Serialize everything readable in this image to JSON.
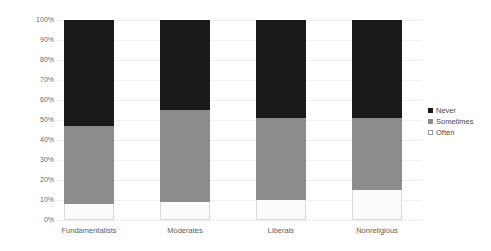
{
  "chart_data": {
    "type": "bar",
    "subtype": "stacked-100-percent",
    "title": "",
    "subtitle": "",
    "xlabel": "",
    "ylabel": "",
    "categories": [
      "Fundamentalists",
      "Moderates",
      "Liberals",
      "Nonreligious"
    ],
    "series": [
      {
        "name": "Never",
        "color": "#1a1a1a",
        "values": [
          53,
          45,
          49,
          49
        ]
      },
      {
        "name": "Sometimes",
        "color": "#8c8c8c",
        "values": [
          39,
          46,
          41,
          36
        ]
      },
      {
        "name": "Often",
        "color": "#ffffff",
        "values": [
          8,
          9,
          10,
          15
        ]
      }
    ],
    "stack_order_bottom_to_top": [
      "Often",
      "Sometimes",
      "Never"
    ],
    "cumulative_tops": {
      "Fundamentalists": {
        "Often": 8,
        "Sometimes": 47,
        "Never": 100
      },
      "Moderates": {
        "Often": 9,
        "Sometimes": 55,
        "Never": 100
      },
      "Liberals": {
        "Often": 10,
        "Sometimes": 51,
        "Never": 100
      },
      "Nonreligious": {
        "Often": 15,
        "Sometimes": 51,
        "Never": 100
      }
    },
    "ylim": [
      0,
      100
    ],
    "ytick_values": [
      0,
      10,
      20,
      30,
      40,
      50,
      60,
      70,
      80,
      90,
      100
    ],
    "ytick_labels": [
      "0%",
      "10%",
      "20%",
      "30%",
      "40%",
      "50%",
      "60%",
      "70%",
      "80%",
      "90%",
      "100%"
    ],
    "grid": true,
    "legend_position": "right",
    "legend_entries": [
      "Never",
      "Sometimes",
      "Often"
    ]
  },
  "legend": {
    "items": [
      {
        "label": "Never",
        "swatch": "legend-swatch-never"
      },
      {
        "label": "Sometimes",
        "swatch": "legend-swatch-sometimes"
      },
      {
        "label": "Often",
        "swatch": "legend-swatch-often"
      }
    ]
  },
  "axis": {
    "y_labels": [
      "100%",
      "90%",
      "80%",
      "70%",
      "60%",
      "50%",
      "40%",
      "30%",
      "20%",
      "10%",
      "0%"
    ],
    "x_labels": [
      "Fundamentalists",
      "Moderates",
      "Liberals",
      "Nonreligious"
    ]
  },
  "colors": {
    "never": "#1a1a1a",
    "sometimes": "#8c8c8c",
    "often": "#ffffff",
    "gridline": "#efefef",
    "tick_text": "#6b6b6b",
    "background": "#ffffff"
  }
}
